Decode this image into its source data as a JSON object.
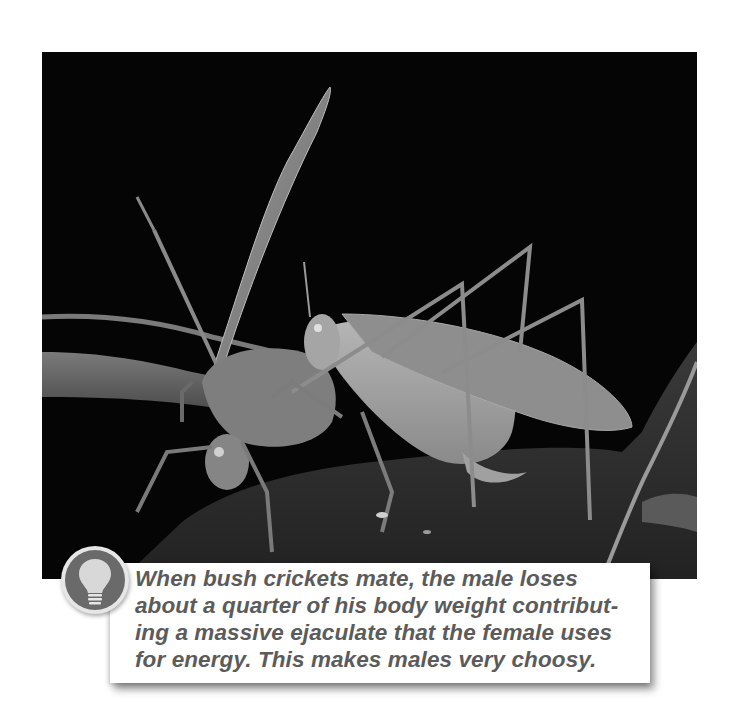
{
  "figure": {
    "photo": {
      "subject": "Two bush crickets mating on a leaf against a black background",
      "background_color": "#050505"
    },
    "callout": {
      "icon": "lightbulb-icon",
      "lines": [
        "When bush crickets mate, the male loses",
        "about a quarter of his body weight contribut-",
        "ing a massive ejaculate that the female uses",
        "for energy. This makes males very choosy."
      ],
      "text_color": "#5b5b5b",
      "box_color": "#ffffff",
      "icon_color": "#6a6a6a"
    }
  }
}
